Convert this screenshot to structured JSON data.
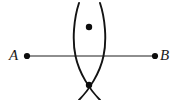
{
  "figure": {
    "background_color": "#ffffff",
    "width": 179,
    "height": 100
  },
  "labels": {
    "point_a": "A",
    "point_b": "B"
  },
  "colors": {
    "segment": "#6a6a6a",
    "arc": "#131313",
    "point": "#0d0d0d",
    "label": "#1a1a1a"
  },
  "geometry": {
    "segment": {
      "x1": 27,
      "y1": 56,
      "x2": 155,
      "y2": 56,
      "stroke_width": 1.6
    },
    "endpoint_a": {
      "cx": 27,
      "cy": 56,
      "r": 3.1
    },
    "endpoint_b": {
      "cx": 155,
      "cy": 56,
      "r": 3.1
    },
    "arc_left": {
      "description": "compass arc centered at A",
      "start_x": 79,
      "start_y": 3,
      "end_x": 100,
      "end_y": 100,
      "control_x": 78,
      "control_y": 56,
      "stroke_width": 1.9
    },
    "arc_right": {
      "description": "compass arc centered at B",
      "start_x": 100,
      "start_y": 3,
      "end_x": 79,
      "end_y": 100,
      "control_x": 101,
      "control_y": 56,
      "stroke_width": 1.9
    },
    "intersection_top": {
      "cx": 89,
      "cy": 27,
      "r": 3.2
    },
    "intersection_bottom": {
      "cx": 89,
      "cy": 85,
      "r": 3.2
    }
  }
}
